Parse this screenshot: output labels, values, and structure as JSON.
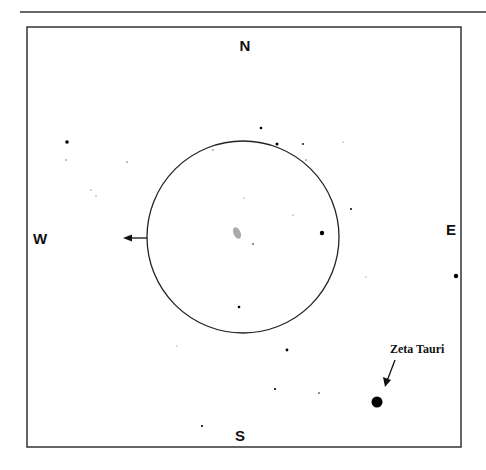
{
  "directions": {
    "north": "N",
    "south": "S",
    "east": "E",
    "west": "W"
  },
  "field_of_view": {
    "center": [
      243,
      237
    ],
    "radius": 96
  },
  "motion_arrow": {
    "from": [
      147,
      238
    ],
    "to": [
      124,
      238
    ]
  },
  "target_star": {
    "label": "Zeta Tauri",
    "position": [
      377,
      402
    ],
    "radius": 5.5,
    "label_position": [
      390,
      353
    ],
    "arrow_from": [
      395,
      360
    ],
    "arrow_to": [
      385,
      386
    ]
  },
  "nebula": {
    "position": [
      237,
      233
    ],
    "color": "#9a9a9a"
  },
  "stars": [
    {
      "x": 67,
      "y": 142,
      "r": 1.8
    },
    {
      "x": 66,
      "y": 160,
      "r": 0.7
    },
    {
      "x": 127,
      "y": 162,
      "r": 0.7
    },
    {
      "x": 91,
      "y": 190,
      "r": 0.6
    },
    {
      "x": 96,
      "y": 196,
      "r": 0.6
    },
    {
      "x": 261,
      "y": 128,
      "r": 1.3
    },
    {
      "x": 277,
      "y": 144,
      "r": 1.5
    },
    {
      "x": 303,
      "y": 144,
      "r": 0.9
    },
    {
      "x": 213,
      "y": 150,
      "r": 0.7
    },
    {
      "x": 306,
      "y": 160,
      "r": 0.7
    },
    {
      "x": 343,
      "y": 142,
      "r": 0.5
    },
    {
      "x": 244,
      "y": 198,
      "r": 0.5
    },
    {
      "x": 351,
      "y": 209,
      "r": 1.0
    },
    {
      "x": 293,
      "y": 215,
      "r": 0.6
    },
    {
      "x": 253,
      "y": 244,
      "r": 0.8
    },
    {
      "x": 322,
      "y": 233,
      "r": 2.2
    },
    {
      "x": 239,
      "y": 307,
      "r": 1.3
    },
    {
      "x": 366,
      "y": 277,
      "r": 0.5
    },
    {
      "x": 456,
      "y": 276,
      "r": 2.2
    },
    {
      "x": 177,
      "y": 346,
      "r": 0.5
    },
    {
      "x": 287,
      "y": 350,
      "r": 1.4
    },
    {
      "x": 275,
      "y": 389,
      "r": 1.1
    },
    {
      "x": 319,
      "y": 393,
      "r": 0.8
    },
    {
      "x": 202,
      "y": 426,
      "r": 1.1
    }
  ]
}
